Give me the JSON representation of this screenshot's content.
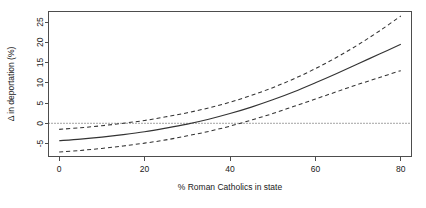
{
  "chart_data": {
    "type": "line",
    "title": "",
    "subtitle": "",
    "xlabel": "% Roman Catholics in state",
    "ylabel": "Δ in deportation (%)",
    "xlim": [
      -2.5,
      82.5
    ],
    "ylim": [
      -8.2,
      27.6
    ],
    "xticks": [
      0,
      20,
      40,
      60,
      80
    ],
    "xtick_labels": [
      "0",
      "20",
      "40",
      "60",
      "80"
    ],
    "yticks": [
      -5,
      0,
      5,
      10,
      15,
      20,
      25
    ],
    "ytick_labels": [
      "-5",
      "0",
      "5",
      "10",
      "15",
      "20",
      "25"
    ],
    "grid": false,
    "legend": null,
    "legend_position": "none",
    "reference_lines": [
      {
        "name": "zero-line",
        "axis": "y",
        "value": 0,
        "style": "dotted"
      }
    ],
    "x": [
      0,
      5,
      10,
      15,
      20,
      25,
      30,
      35,
      40,
      45,
      50,
      55,
      60,
      65,
      70,
      75,
      80
    ],
    "series": [
      {
        "name": "fitted effect",
        "style": "solid",
        "values": [
          -4.3,
          -3.9,
          -3.4,
          -2.8,
          -2.1,
          -1.2,
          -0.2,
          1.0,
          2.4,
          4.0,
          5.8,
          7.8,
          10.0,
          12.3,
          14.7,
          17.1,
          19.5
        ]
      },
      {
        "name": "upper 95% confidence band",
        "style": "dashed",
        "values": [
          -1.5,
          -1.1,
          -0.6,
          0.0,
          0.7,
          1.6,
          2.6,
          3.8,
          5.2,
          6.9,
          8.8,
          11.0,
          13.5,
          16.3,
          19.4,
          22.8,
          26.5
        ]
      },
      {
        "name": "lower 95% confidence band",
        "style": "dashed",
        "values": [
          -7.1,
          -6.7,
          -6.2,
          -5.6,
          -4.9,
          -4.1,
          -3.1,
          -2.0,
          -0.7,
          0.8,
          2.4,
          4.2,
          6.0,
          7.8,
          9.6,
          11.3,
          13.0
        ]
      }
    ],
    "colors": {
      "fit": "#333333",
      "band": "#333333",
      "axis": "#4d4d4d",
      "background": "#ffffff",
      "text": "#1a1a1a"
    }
  }
}
